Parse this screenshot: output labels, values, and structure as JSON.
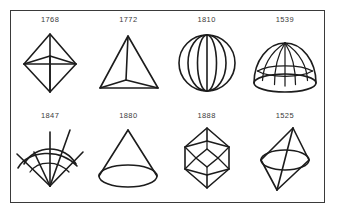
{
  "plate": {
    "background_color": "#ffffff",
    "border_color": "#3a3a3a",
    "ink_color": "#1c1c1c",
    "label_color": "#3b3b3b",
    "rows": 2,
    "columns": 4
  },
  "figures": [
    {
      "label": "1768",
      "shape_name": "square-bipyramid",
      "icon": "bipyramid-icon",
      "row": 1,
      "column": 1
    },
    {
      "label": "1772",
      "shape_name": "tetrahedron",
      "icon": "tetrahedron-icon",
      "row": 1,
      "column": 2
    },
    {
      "label": "1810",
      "shape_name": "sphere-with-meridians",
      "icon": "sphere-icon",
      "row": 1,
      "column": 3
    },
    {
      "label": "1539",
      "shape_name": "hemisphere-dome-grid",
      "icon": "dome-icon",
      "row": 1,
      "column": 4
    },
    {
      "label": "1847",
      "shape_name": "radiating-fan-with-arcs",
      "icon": "fan-icon",
      "row": 2,
      "column": 1
    },
    {
      "label": "1880",
      "shape_name": "cone",
      "icon": "cone-icon",
      "row": 2,
      "column": 2
    },
    {
      "label": "1888",
      "shape_name": "rhombohedral-crystal",
      "icon": "crystal-icon",
      "row": 2,
      "column": 3
    },
    {
      "label": "1525",
      "shape_name": "bicone-with-equator",
      "icon": "bicone-icon",
      "row": 2,
      "column": 4
    }
  ]
}
